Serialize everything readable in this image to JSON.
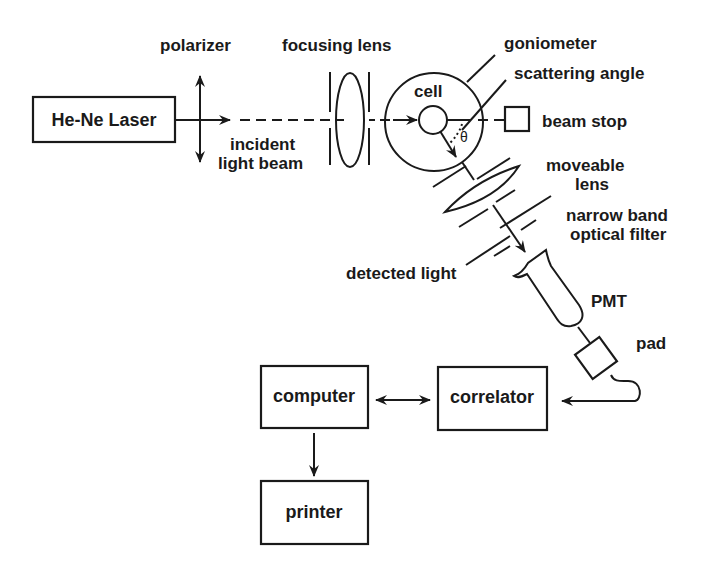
{
  "diagram": {
    "type": "block-schematic",
    "components": {
      "laser": "He-Ne Laser",
      "polarizer": "polarizer",
      "incident_beam_line1": "incident",
      "incident_beam_line2": "light beam",
      "focusing_lens": "focusing lens",
      "goniometer": "goniometer",
      "cell": "cell",
      "scattering_angle": "scattering angle",
      "theta": "θ",
      "beam_stop": "beam stop",
      "moveable_lens_line1": "moveable",
      "moveable_lens_line2": "lens",
      "filter_line1": "narrow band",
      "filter_line2": "optical filter",
      "detected_light": "detected light",
      "pmt": "PMT",
      "pad": "pad",
      "computer": "computer",
      "correlator": "correlator",
      "printer": "printer"
    },
    "connections": [
      {
        "from": "He-Ne Laser",
        "to": "cell",
        "label": "incident light beam"
      },
      {
        "from": "cell",
        "to": "PMT",
        "label": "detected light"
      },
      {
        "from": "PMT",
        "to": "pad"
      },
      {
        "from": "pad",
        "to": "correlator"
      },
      {
        "from": "correlator",
        "to": "computer",
        "bidirectional": true
      },
      {
        "from": "computer",
        "to": "printer"
      }
    ],
    "colors": {
      "ink": "#1a1a1a",
      "background": "#ffffff"
    }
  }
}
